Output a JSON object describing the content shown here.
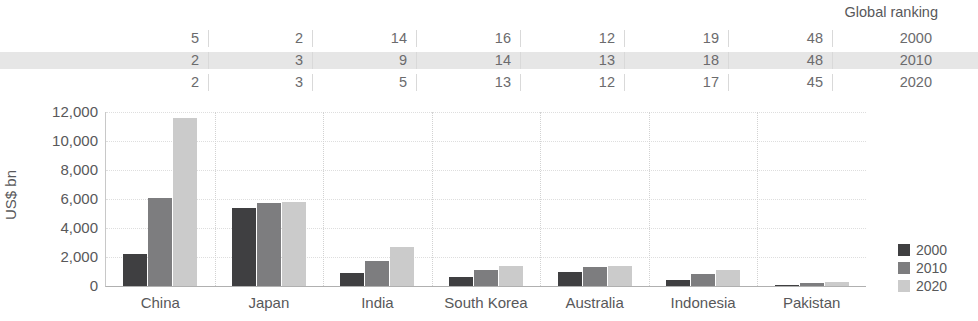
{
  "chart_data": {
    "type": "bar",
    "title": "",
    "subtitle": "",
    "xlabel": "",
    "ylabel": "US$ bn",
    "ylim": [
      0,
      12000
    ],
    "yticks": [
      0,
      2000,
      4000,
      6000,
      8000,
      10000,
      12000
    ],
    "ytick_labels": [
      "0",
      "2,000",
      "4,000",
      "6,000",
      "8,000",
      "10,000",
      "12,000"
    ],
    "grid": true,
    "legend_position": "right",
    "categories": [
      "China",
      "Japan",
      "India",
      "South Korea",
      "Australia",
      "Indonesia",
      "Pakistan"
    ],
    "series": [
      {
        "name": "2000",
        "color": "#3f3f41",
        "values": [
          2200,
          5400,
          900,
          620,
          1000,
          400,
          90
        ]
      },
      {
        "name": "2010",
        "color": "#7d7d7f",
        "values": [
          6100,
          5700,
          1700,
          1100,
          1300,
          800,
          180
        ]
      },
      {
        "name": "2020",
        "color": "#cbcbcb",
        "values": [
          11600,
          5800,
          2700,
          1400,
          1400,
          1100,
          270
        ]
      }
    ],
    "annotation_table": {
      "title": "Global ranking",
      "row_labels": [
        "2000",
        "2010",
        "2020"
      ],
      "highlighted_row_index": 1,
      "rows": [
        [
          5,
          2,
          14,
          16,
          12,
          19,
          48
        ],
        [
          2,
          3,
          9,
          14,
          13,
          18,
          48
        ],
        [
          2,
          3,
          5,
          13,
          12,
          17,
          45
        ]
      ]
    }
  }
}
